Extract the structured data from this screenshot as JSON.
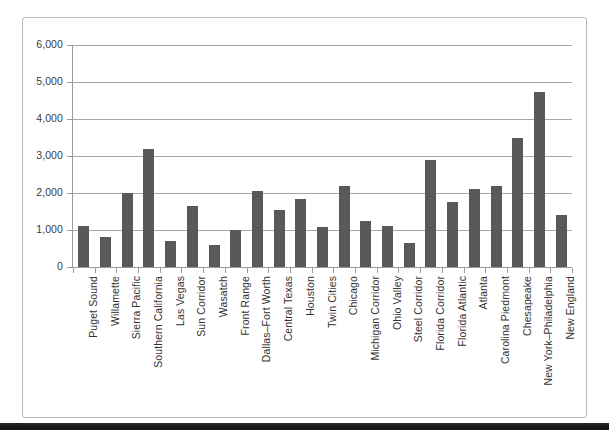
{
  "chart_data": {
    "type": "bar",
    "title": "",
    "subtitle": "",
    "xlabel": "",
    "ylabel": "",
    "ylim": [
      0,
      6000
    ],
    "ytick_labels": [
      "0",
      "1,000",
      "2,000",
      "3,000",
      "4,000",
      "5,000",
      "6,000"
    ],
    "ytick_values": [
      0,
      1000,
      2000,
      3000,
      4000,
      5000,
      6000
    ],
    "grid": "horizontal",
    "legend": "none",
    "bar_color": "#595959",
    "gridline_color": "#a6a6a6",
    "axis_color": "#9a9a9a",
    "categories": [
      "Puget Sound",
      "Willamette",
      "Sierra Pacific",
      "Southern California",
      "Las Vegas",
      "Sun Corridor",
      "Wasatch",
      "Front Range",
      "Dallas–Fort Worth",
      "Central Texas",
      "Houston",
      "Twin Cities",
      "Chicago",
      "Michigan Corridor",
      "Ohio Valley",
      "Steel Corridor",
      "Florida Corridor",
      "Florida Atlantic",
      "Atlanta",
      "Carolina Piedmont",
      "Chesapeake",
      "New York–Philadelphia",
      "New England"
    ],
    "values": [
      1100,
      820,
      2000,
      3200,
      700,
      1650,
      600,
      1000,
      2050,
      1550,
      1850,
      1080,
      2180,
      1250,
      1100,
      650,
      2900,
      1750,
      2120,
      2200,
      3480,
      4720,
      1400
    ]
  }
}
